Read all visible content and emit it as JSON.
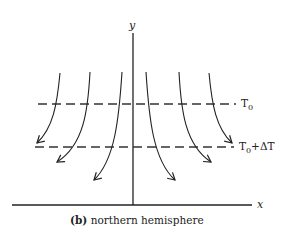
{
  "diagram": {
    "axes": {
      "x_label": "x",
      "y_label": "y"
    },
    "isotherms": [
      {
        "label": "T",
        "subscript": "0",
        "suffix": ""
      },
      {
        "label": "T",
        "subscript": "0",
        "suffix": "+ΔT"
      }
    ],
    "caption": {
      "tag": "(b)",
      "text": "northern hemisphere"
    },
    "flow_lines": 6,
    "colors": {
      "stroke": "#222222",
      "background": "#ffffff"
    }
  }
}
